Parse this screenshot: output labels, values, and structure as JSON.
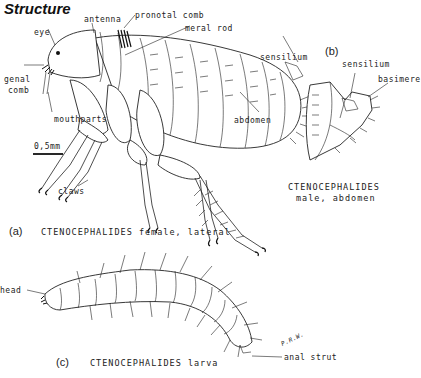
{
  "title": "Structure",
  "panel_a": {
    "marker": "(a)",
    "caption": "CTENOCEPHALIDES female, lateral",
    "labels": {
      "antenna": "antenna",
      "pronotal_comb": "pronotal comb",
      "eye": "eye",
      "meral_rod": "meral rod",
      "sensilium": "sensilium",
      "genal_comb_1": "genal",
      "genal_comb_2": "comb",
      "mouthparts": "mouthparts",
      "abdomen": "abdomen",
      "claws": "claws"
    },
    "scale_bar": "0,5mm"
  },
  "panel_b": {
    "marker": "(b)",
    "caption_line1": "CTENOCEPHALIDES",
    "caption_line2": "male, abdomen",
    "labels": {
      "sensilium": "sensilium",
      "basimere": "basimere"
    }
  },
  "panel_c": {
    "marker": "(c)",
    "caption": "CTENOCEPHALIDES larva",
    "labels": {
      "head": "head",
      "anal_strut": "anal strut"
    },
    "signature": "P.R.W."
  }
}
